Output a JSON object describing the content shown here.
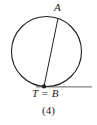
{
  "figure": {
    "caption": "(4)",
    "background_color": "#ffffff",
    "stroke_color": "#231f20",
    "tangent_color": "#808080",
    "labels": {
      "point_a": "A",
      "point_t_equals_b": "T = B"
    },
    "icons": {
      "tangent_point_marker": "filled-dot-icon"
    }
  },
  "chart_data": {
    "type": "diagram",
    "title": "(4)",
    "circle": {
      "center_x": 46.5,
      "center_y": 51.5,
      "radius": 35.0,
      "stroke_width": 1.1
    },
    "points": [
      {
        "name": "A",
        "x": 58.0,
        "y": 18.4,
        "marker": "none",
        "label": "A",
        "label_x": 57.5,
        "label_y": 8.0
      },
      {
        "name": "T = B",
        "x": 44.0,
        "y": 86.4,
        "marker": "filled-dot",
        "label": "T = B",
        "label_x": 46.0,
        "label_y": 94.0
      }
    ],
    "segments": [
      {
        "name": "chord-a-to-t",
        "x1": 58.0,
        "y1": 18.4,
        "x2": 44.0,
        "y2": 86.4,
        "stroke": "#231f20",
        "width": 1.0
      },
      {
        "name": "tangent-line-at-t",
        "x1": 36.0,
        "y1": 86.9,
        "x2": 92.0,
        "y2": 86.9,
        "stroke": "#808080",
        "width": 1.4
      }
    ]
  }
}
